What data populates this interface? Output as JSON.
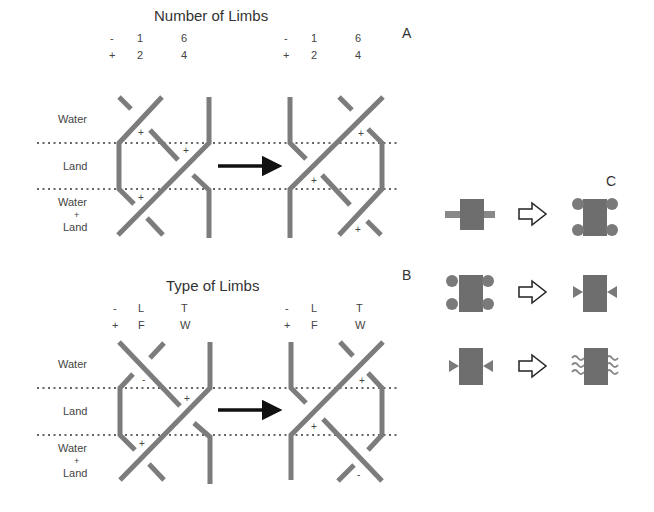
{
  "panel_a": {
    "letter": "A",
    "title": "Number of Limbs",
    "left_header": {
      "minus": "-",
      "plus": "+",
      "col1_top": "1",
      "col1_bottom": "2",
      "col2_top": "6",
      "col2_bottom": "4"
    },
    "right_header": {
      "minus": "-",
      "plus": "+",
      "col1_top": "1",
      "col1_bottom": "2",
      "col2_top": "6",
      "col2_bottom": "4"
    },
    "rows": [
      "Water",
      "Land",
      "Water",
      "+",
      "Land"
    ],
    "signs_left": [
      "+",
      "+",
      "+"
    ],
    "signs_right": [
      "+",
      "+",
      "+"
    ]
  },
  "panel_b": {
    "letter": "B",
    "title": "Type of Limbs",
    "left_header": {
      "minus": "-",
      "plus": "+",
      "col1_top": "L",
      "col1_bottom": "F",
      "col2_top": "T",
      "col2_bottom": "W"
    },
    "right_header": {
      "minus": "-",
      "plus": "+",
      "col1_top": "L",
      "col1_bottom": "F",
      "col2_top": "T",
      "col2_bottom": "W"
    },
    "rows": [
      "Water",
      "Land",
      "Water",
      "+",
      "Land"
    ],
    "signs_left": [
      "-",
      "+",
      "+"
    ],
    "signs_right": [
      "+",
      "+",
      "-"
    ]
  },
  "panel_c": {
    "letter": "C",
    "transitions": [
      {
        "from": "body-with-bar-limbs",
        "to": "body-with-round-limbs"
      },
      {
        "from": "body-with-round-limbs",
        "to": "body-with-triangle-limbs"
      },
      {
        "from": "body-with-triangle-limbs",
        "to": "body-with-wavy-limbs"
      }
    ]
  },
  "colors": {
    "stroke": "#7a7a7a",
    "body": "#6e6e6e",
    "arrow": "#111111",
    "dots": "#666666"
  }
}
